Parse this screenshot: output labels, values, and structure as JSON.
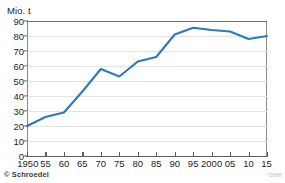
{
  "chart_data": {
    "type": "line",
    "title": "",
    "subtitle": "",
    "xlabel": "",
    "ylabel": "Mio. t",
    "y_unit_caption": "Mio. t",
    "grid": true,
    "legend": null,
    "legend_position": "none",
    "line_color": "#2E78BC",
    "grid_color": "#E3E3E3",
    "axis_color": "#5E5E5E",
    "frame_color": "#8A8A8A",
    "xlim": [
      1950,
      2015
    ],
    "ylim": [
      0,
      90
    ],
    "ytick_values": [
      0,
      10,
      20,
      30,
      40,
      50,
      60,
      70,
      80,
      90
    ],
    "ytick_labels": [
      "0",
      "10",
      "20",
      "30",
      "40",
      "50",
      "60",
      "70",
      "80",
      "90"
    ],
    "xtick_values": [
      1950,
      1955,
      1960,
      1965,
      1970,
      1975,
      1980,
      1985,
      1990,
      1995,
      2000,
      2005,
      2010,
      2015
    ],
    "xtick_labels": [
      "1950",
      "55",
      "60",
      "65",
      "70",
      "75",
      "80",
      "85",
      "90",
      "95",
      "2000",
      "05",
      "10",
      "15"
    ],
    "x": [
      1950,
      1955,
      1960,
      1965,
      1970,
      1975,
      1980,
      1985,
      1990,
      1995,
      2000,
      2005,
      2010,
      2015
    ],
    "values": [
      20,
      26,
      29,
      43,
      58,
      53,
      63,
      66,
      81,
      85.5,
      84,
      83,
      78,
      80
    ]
  },
  "footer": {
    "credit": "© Schroedel",
    "reference_code": "7266H"
  }
}
